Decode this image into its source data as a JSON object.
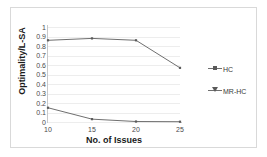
{
  "chart_data": {
    "type": "line",
    "title": "",
    "xlabel": "No. of Issues",
    "ylabel": "Optimality/L-SA",
    "x": [
      10,
      15,
      20,
      25
    ],
    "xtick_labels": [
      "10",
      "15",
      "20",
      "25"
    ],
    "ytick_labels": [
      "1",
      "0.9",
      "0.8",
      "0.7",
      "0.6",
      "0.5",
      "0.4",
      "0.3",
      "0.2",
      "0.1",
      "0"
    ],
    "ylim": [
      0,
      1
    ],
    "xlim": [
      10,
      25
    ],
    "grid": true,
    "legend_position": "right",
    "series": [
      {
        "name": "HC",
        "marker": "line-marker",
        "color": "#6f6f6f",
        "values": [
          0.86,
          0.88,
          0.86,
          0.57
        ]
      },
      {
        "name": "MR-HC",
        "marker": "triangle-marker",
        "color": "#6f6f6f",
        "values": [
          0.15,
          0.03,
          0.005,
          0.003
        ]
      }
    ]
  },
  "legend": {
    "entries": [
      {
        "label": "HC"
      },
      {
        "label": "MR-HC"
      }
    ]
  },
  "colors": {
    "series_line": "#6f6f6f",
    "grid": "#ededed",
    "axis": "#c9c9c9",
    "text": "#1a1a1a",
    "tick_text": "#4a4a4a",
    "border": "#d9d9d9",
    "background": "#ffffff"
  }
}
